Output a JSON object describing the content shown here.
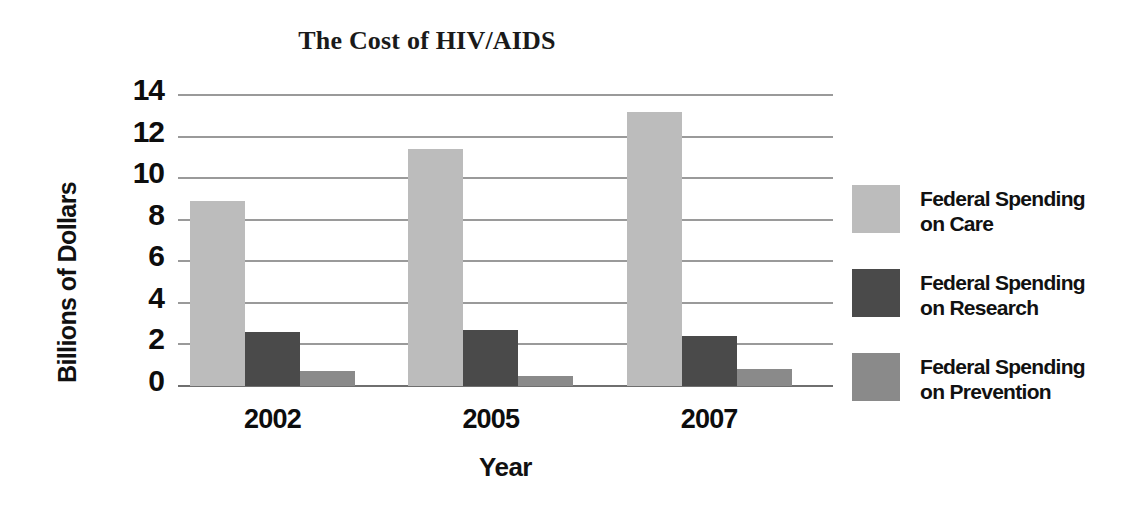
{
  "chart_data": {
    "type": "bar",
    "title": "The Cost of HIV/AIDS",
    "xlabel": "Year",
    "ylabel": "Billions of Dollars",
    "categories": [
      "2002",
      "2005",
      "2007"
    ],
    "series": [
      {
        "name": "Federal Spending\non Care",
        "key": "care",
        "color": "#bcbcbc",
        "values": [
          8.9,
          11.4,
          13.2
        ]
      },
      {
        "name": "Federal Spending\non Research",
        "key": "research",
        "color": "#4a4a4a",
        "values": [
          2.6,
          2.7,
          2.4
        ]
      },
      {
        "name": "Federal Spending\non Prevention",
        "key": "prevention",
        "color": "#8a8a8a",
        "values": [
          0.7,
          0.5,
          0.8
        ]
      }
    ],
    "ylim": [
      0,
      14
    ],
    "yticks": [
      0,
      2,
      4,
      6,
      8,
      10,
      12,
      14
    ],
    "ytick_labels": [
      "0",
      "2",
      "4",
      "6",
      "8",
      "10",
      "12",
      "14"
    ],
    "grid": true,
    "legend_position": "right",
    "gridline_color": "#9a9a9a",
    "text_color": "#111111",
    "background": "#ffffff"
  },
  "legend": {
    "items": [
      {
        "label": "Federal Spending\non Care",
        "color": "#bcbcbc"
      },
      {
        "label": "Federal Spending\non Research",
        "color": "#4a4a4a"
      },
      {
        "label": "Federal Spending\non Prevention",
        "color": "#8a8a8a"
      }
    ]
  }
}
